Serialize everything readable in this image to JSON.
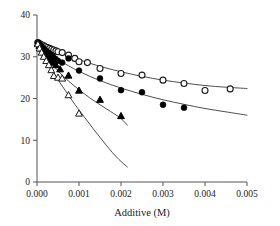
{
  "chart_data": {
    "type": "scatter",
    "title": "",
    "subtitle": "",
    "xlabel": "Additive (M)",
    "ylabel": "",
    "xlim": [
      0.0,
      0.005
    ],
    "ylim": [
      0,
      40
    ],
    "xticks": [
      "0.000",
      "0.001",
      "0.002",
      "0.003",
      "0.004",
      "0.005"
    ],
    "xtick_values": [
      0.0,
      0.001,
      0.002,
      0.003,
      0.004,
      0.005
    ],
    "yticks": [
      "0",
      "10",
      "20",
      "30",
      "40"
    ],
    "ytick_values": [
      0,
      10,
      20,
      30,
      40
    ],
    "grid": false,
    "legend": "none",
    "series": [
      {
        "name": "open-circles",
        "marker": "circle-open",
        "color": "#1a1a1a",
        "x": [
          2e-05,
          5e-05,
          8e-05,
          0.00012,
          0.00016,
          0.0002,
          0.00025,
          0.0003,
          0.00035,
          0.0004,
          0.00045,
          0.0005,
          0.0006,
          0.00075,
          0.0009,
          0.001,
          0.0012,
          0.0015,
          0.002,
          0.0025,
          0.003,
          0.0035,
          0.004,
          0.0046
        ],
        "y": [
          33.4,
          33.2,
          33.0,
          32.8,
          32.6,
          32.4,
          32.2,
          32.0,
          31.8,
          31.6,
          31.4,
          31.2,
          31.0,
          30.4,
          29.6,
          28.8,
          28.6,
          27.2,
          26.0,
          25.6,
          24.4,
          23.6,
          21.9,
          22.3
        ],
        "fit_x": [
          0.0,
          0.0005,
          0.001,
          0.0015,
          0.002,
          0.0025,
          0.003,
          0.0035,
          0.004,
          0.0045,
          0.005
        ],
        "fit_y": [
          33.4,
          31.2,
          29.3,
          27.7,
          26.4,
          25.3,
          24.4,
          23.7,
          23.1,
          22.7,
          22.4
        ]
      },
      {
        "name": "filled-circles",
        "marker": "circle-filled",
        "color": "#000000",
        "x": [
          2e-05,
          5e-05,
          9e-05,
          0.00013,
          0.00017,
          0.00022,
          0.00027,
          0.00032,
          0.00038,
          0.00044,
          0.0005,
          0.0006,
          0.00075,
          0.001,
          0.0015,
          0.002,
          0.0025,
          0.003,
          0.0035
        ],
        "y": [
          33.3,
          33.0,
          32.6,
          32.2,
          31.8,
          31.4,
          31.0,
          30.5,
          30.0,
          29.5,
          29.0,
          28.6,
          29.6,
          26.7,
          24.8,
          22.0,
          21.5,
          18.5,
          17.8
        ],
        "fit_x": [
          0.0,
          0.0005,
          0.001,
          0.0015,
          0.002,
          0.0025,
          0.003,
          0.0035,
          0.004,
          0.0045,
          0.005
        ],
        "fit_y": [
          33.3,
          29.4,
          26.5,
          24.3,
          22.5,
          21.0,
          19.7,
          18.6,
          17.6,
          16.8,
          16.0
        ]
      },
      {
        "name": "filled-triangles",
        "marker": "triangle-filled",
        "color": "#000000",
        "x": [
          2e-05,
          6e-05,
          0.0001,
          0.00015,
          0.0002,
          0.00026,
          0.00032,
          0.00038,
          0.00045,
          0.00055,
          0.00075,
          0.001,
          0.0015,
          0.002
        ],
        "y": [
          33.2,
          32.6,
          32.0,
          31.3,
          30.6,
          29.9,
          29.2,
          28.6,
          28.0,
          27.0,
          25.5,
          21.9,
          19.7,
          15.8
        ],
        "fit_x": [
          0.0,
          0.00025,
          0.0005,
          0.00075,
          0.001,
          0.00125,
          0.0015,
          0.00175,
          0.002,
          0.00215
        ],
        "fit_y": [
          33.2,
          29.6,
          26.6,
          24.2,
          22.1,
          20.2,
          18.5,
          16.9,
          15.2,
          13.6
        ]
      },
      {
        "name": "open-triangles",
        "marker": "triangle-open",
        "color": "#1a1a1a",
        "x": [
          2e-05,
          6e-05,
          0.00011,
          0.00016,
          0.00022,
          0.00028,
          0.00034,
          0.0004,
          0.0005,
          0.0006,
          0.00075,
          0.001
        ],
        "y": [
          33.0,
          32.0,
          31.0,
          30.0,
          29.0,
          28.0,
          26.8,
          25.4,
          25.0,
          24.8,
          20.8,
          16.4
        ],
        "fit_x": [
          0.0,
          0.00015,
          0.0003,
          0.00045,
          0.0006,
          0.00075,
          0.0009,
          0.00105,
          0.0012,
          0.00135,
          0.0015,
          0.00165,
          0.0018,
          0.00195,
          0.00215
        ],
        "fit_y": [
          33.0,
          30.2,
          27.6,
          25.2,
          23.0,
          20.8,
          18.6,
          16.6,
          14.6,
          12.6,
          10.7,
          8.8,
          7.0,
          5.4,
          3.6
        ]
      }
    ]
  }
}
